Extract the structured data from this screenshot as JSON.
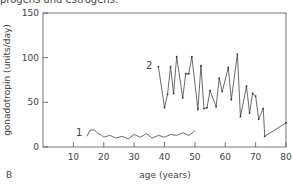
{
  "header_fragment": "progens and estrogens.",
  "panel_label": "B",
  "chart_data": {
    "type": "line",
    "title": "",
    "xlabel": "age (years)",
    "ylabel": "gonadotropin (units/day)",
    "xlim": [
      0,
      80
    ],
    "ylim": [
      0,
      150
    ],
    "xticks": [
      10,
      20,
      30,
      40,
      50,
      60,
      70,
      80
    ],
    "yticks": [
      0,
      50,
      100,
      150
    ],
    "grid": false,
    "series": [
      {
        "name": "1",
        "x": [
          14.5,
          15.5,
          17,
          18,
          19,
          20,
          22,
          24,
          26,
          28,
          30,
          32,
          34,
          36,
          38,
          40,
          42,
          44,
          46,
          48,
          50
        ],
        "y": [
          12,
          19,
          19,
          15,
          14,
          11,
          13,
          10,
          12,
          9,
          14,
          11,
          15,
          10,
          13,
          11,
          14,
          13,
          16,
          13,
          18
        ]
      },
      {
        "name": "2",
        "x": [
          38,
          40,
          41,
          42,
          43,
          44,
          46,
          47,
          48,
          49,
          51,
          52,
          53,
          54,
          55,
          57,
          58,
          59,
          61,
          62,
          64,
          65,
          67,
          68,
          69,
          70,
          71,
          72.5,
          73,
          80
        ],
        "y": [
          90,
          44,
          59,
          90,
          60,
          101,
          55,
          82,
          82,
          101,
          42,
          91,
          43,
          44,
          63,
          45,
          77,
          62,
          89,
          53,
          104,
          34,
          68,
          38,
          60,
          57,
          31,
          43,
          12,
          27
        ]
      }
    ],
    "annotations": [
      {
        "text": "1",
        "x": 13,
        "y": 12
      },
      {
        "text": "2",
        "x": 36,
        "y": 87
      }
    ]
  }
}
